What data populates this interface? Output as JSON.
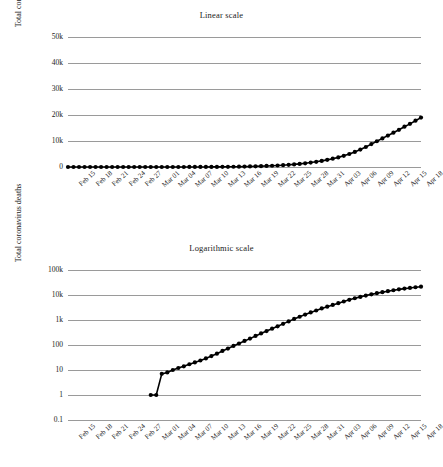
{
  "figure": {
    "ylabel": "Total coronavirus deaths"
  },
  "chart_data": [
    {
      "type": "line",
      "id": "linear",
      "title": "Linear scale",
      "xlabel": "",
      "ylabel": "Total coronavirus deaths",
      "yscale": "linear",
      "ylim": [
        0,
        50000
      ],
      "yticks": [
        0,
        10000,
        20000,
        30000,
        40000,
        50000
      ],
      "ytick_labels": [
        "0",
        "10k",
        "20k",
        "30k",
        "40k",
        "50k"
      ],
      "grid": true,
      "legend": "none",
      "marker": "circle",
      "color": "#000000",
      "xtick_labels": [
        "Feb 15",
        "Feb 18",
        "Feb 21",
        "Feb 24",
        "Feb 27",
        "Mar 01",
        "Mar 04",
        "Mar 07",
        "Mar 10",
        "Mar 13",
        "Mar 16",
        "Mar 19",
        "Mar 22",
        "Mar 25",
        "Mar 28",
        "Mar 31",
        "Apr 03",
        "Apr 06",
        "Apr 09",
        "Apr 12",
        "Apr 15",
        "Apr 18"
      ],
      "x": [
        "Feb 15",
        "Feb 16",
        "Feb 17",
        "Feb 18",
        "Feb 19",
        "Feb 20",
        "Feb 21",
        "Feb 22",
        "Feb 23",
        "Feb 24",
        "Feb 25",
        "Feb 26",
        "Feb 27",
        "Feb 28",
        "Feb 29",
        "Mar 01",
        "Mar 02",
        "Mar 03",
        "Mar 04",
        "Mar 05",
        "Mar 06",
        "Mar 07",
        "Mar 08",
        "Mar 09",
        "Mar 10",
        "Mar 11",
        "Mar 12",
        "Mar 13",
        "Mar 14",
        "Mar 15",
        "Mar 16",
        "Mar 17",
        "Mar 18",
        "Mar 19",
        "Mar 20",
        "Mar 21",
        "Mar 22",
        "Mar 23",
        "Mar 24",
        "Mar 25",
        "Mar 26",
        "Mar 27",
        "Mar 28",
        "Mar 29",
        "Mar 30",
        "Mar 31",
        "Apr 01",
        "Apr 02",
        "Apr 03",
        "Apr 04",
        "Apr 05",
        "Apr 06",
        "Apr 07",
        "Apr 08",
        "Apr 09",
        "Apr 10",
        "Apr 11",
        "Apr 12",
        "Apr 13",
        "Apr 14",
        "Apr 15",
        "Apr 16",
        "Apr 17",
        "Apr 18",
        "Apr 19"
      ],
      "values": [
        0,
        0,
        0,
        0,
        0,
        0,
        0,
        0,
        0,
        0,
        0,
        0,
        0,
        0,
        0,
        1,
        1,
        2,
        3,
        4,
        6,
        8,
        11,
        14,
        18,
        23,
        30,
        40,
        55,
        72,
        95,
        125,
        160,
        205,
        260,
        320,
        395,
        480,
        580,
        700,
        840,
        1000,
        1200,
        1420,
        1700,
        2000,
        2350,
        2750,
        3200,
        3700,
        4300,
        5000,
        5800,
        6700,
        7700,
        8800,
        9900,
        11000,
        12100,
        13200,
        14300,
        15500,
        16600,
        17800,
        19000
      ]
    },
    {
      "type": "line",
      "id": "log",
      "title": "Logarithmic scale",
      "xlabel": "",
      "ylabel": "Total coronavirus deaths",
      "yscale": "log",
      "ylim": [
        0.1,
        100000
      ],
      "yticks": [
        0.1,
        1,
        10,
        100,
        1000,
        10000,
        100000
      ],
      "ytick_labels": [
        "0.1",
        "1",
        "10",
        "100",
        "1k",
        "10k",
        "100k"
      ],
      "grid": true,
      "legend": "none",
      "marker": "circle",
      "color": "#000000",
      "xtick_labels": [
        "Feb 15",
        "Feb 18",
        "Feb 21",
        "Feb 24",
        "Feb 27",
        "Mar 01",
        "Mar 04",
        "Mar 07",
        "Mar 10",
        "Mar 13",
        "Mar 16",
        "Mar 19",
        "Mar 22",
        "Mar 25",
        "Mar 28",
        "Mar 31",
        "Apr 03",
        "Apr 06",
        "Apr 09",
        "Apr 12",
        "Apr 15",
        "Apr 18"
      ],
      "x": [
        "Mar 01",
        "Mar 02",
        "Mar 03",
        "Mar 04",
        "Mar 05",
        "Mar 06",
        "Mar 07",
        "Mar 08",
        "Mar 09",
        "Mar 10",
        "Mar 11",
        "Mar 12",
        "Mar 13",
        "Mar 14",
        "Mar 15",
        "Mar 16",
        "Mar 17",
        "Mar 18",
        "Mar 19",
        "Mar 20",
        "Mar 21",
        "Mar 22",
        "Mar 23",
        "Mar 24",
        "Mar 25",
        "Mar 26",
        "Mar 27",
        "Mar 28",
        "Mar 29",
        "Mar 30",
        "Mar 31",
        "Apr 01",
        "Apr 02",
        "Apr 03",
        "Apr 04",
        "Apr 05",
        "Apr 06",
        "Apr 07",
        "Apr 08",
        "Apr 09",
        "Apr 10",
        "Apr 11",
        "Apr 12",
        "Apr 13",
        "Apr 14",
        "Apr 15",
        "Apr 16",
        "Apr 17",
        "Apr 18",
        "Apr 19"
      ],
      "values": [
        1,
        1,
        7,
        8,
        10,
        12,
        14,
        17,
        20,
        24,
        29,
        36,
        45,
        58,
        72,
        92,
        115,
        145,
        180,
        230,
        290,
        360,
        450,
        560,
        700,
        880,
        1100,
        1350,
        1650,
        2000,
        2400,
        2900,
        3400,
        4000,
        4700,
        5500,
        6400,
        7400,
        8400,
        9500,
        10600,
        11800,
        13000,
        14200,
        15500,
        16800,
        18000,
        19200,
        20400,
        21500
      ]
    }
  ]
}
